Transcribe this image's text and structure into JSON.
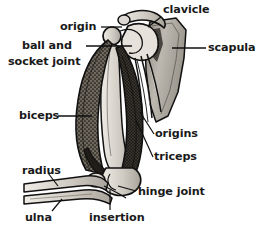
{
  "figure": {
    "style": "black-and-white stippled engraving line drawing",
    "background_color": "#ffffff",
    "line_color": "#111111",
    "bone_fill_color": "#c9c6bf",
    "muscle_fill_color": "#4a4640",
    "label_text_color": "#1a1a1a"
  },
  "labels": {
    "origin": "origin",
    "ball_and": "ball and",
    "socket_joint": "socket joint",
    "clavicle": "clavicle",
    "scapula": "scapula",
    "biceps": "biceps",
    "origins": "origins",
    "triceps": "triceps",
    "radius": "radius",
    "hinge_joint": "hinge joint",
    "insertion": "insertion",
    "ulna": "ulna"
  },
  "parts": [
    {
      "name": "clavicle",
      "type": "bone",
      "position": "top centre-right"
    },
    {
      "name": "scapula",
      "type": "bone",
      "position": "right, blade shaped"
    },
    {
      "name": "humerus",
      "type": "bone",
      "position": "upper arm, vertical"
    },
    {
      "name": "radius",
      "type": "bone",
      "position": "forearm, upper of two"
    },
    {
      "name": "ulna",
      "type": "bone",
      "position": "forearm, lower of two"
    },
    {
      "name": "biceps",
      "type": "muscle",
      "position": "anterior upper arm, left"
    },
    {
      "name": "triceps",
      "type": "muscle",
      "position": "posterior upper arm, right"
    },
    {
      "name": "ball and socket joint",
      "type": "joint",
      "position": "shoulder"
    },
    {
      "name": "hinge joint",
      "type": "joint",
      "position": "elbow"
    },
    {
      "name": "origin",
      "type": "attachment",
      "position": "biceps head at shoulder"
    },
    {
      "name": "origins",
      "type": "attachment",
      "position": "triceps heads at scapula/humerus"
    },
    {
      "name": "insertion",
      "type": "attachment",
      "position": "below elbow on forearm"
    }
  ]
}
